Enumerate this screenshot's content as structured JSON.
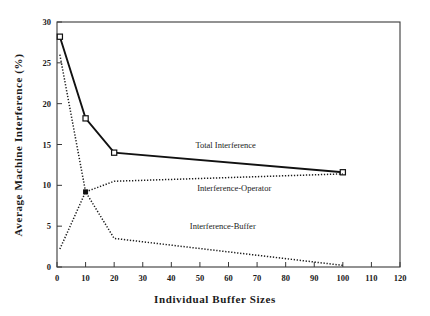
{
  "chart_data": {
    "type": "line",
    "title": "",
    "xlabel": "Individual Buffer Sizes",
    "ylabel": "Average Machine Interference (%)",
    "xlim": [
      0,
      120
    ],
    "ylim": [
      0,
      30
    ],
    "xticks": [
      0,
      10,
      20,
      30,
      40,
      50,
      60,
      70,
      80,
      90,
      100,
      110,
      120
    ],
    "yticks": [
      0,
      5,
      10,
      15,
      20,
      25,
      30
    ],
    "xtick_labels": [
      "0",
      "10",
      "20",
      "30",
      "40",
      "50",
      "60",
      "70",
      "80",
      "90",
      "100",
      "110",
      "120"
    ],
    "ytick_labels": [
      "0",
      "5",
      "10",
      "15",
      "20",
      "25",
      "30"
    ],
    "grid": false,
    "legend_position": "inline-annotations",
    "series": [
      {
        "name": "Total Interference",
        "style": "solid",
        "marker": "open-square",
        "x": [
          1,
          10,
          20,
          100
        ],
        "values": [
          28.2,
          18.2,
          14.0,
          11.6
        ]
      },
      {
        "name": "Interference-Operator",
        "style": "dotted",
        "marker": "none",
        "x": [
          1,
          10,
          20,
          100
        ],
        "values": [
          2.2,
          9.2,
          10.5,
          11.4
        ]
      },
      {
        "name": "Interference-Buffer",
        "style": "dotted",
        "marker": "none",
        "x": [
          1,
          10,
          20,
          100
        ],
        "values": [
          26.0,
          9.2,
          3.5,
          0.2
        ]
      }
    ],
    "annotations": [
      {
        "text": "Total Interference",
        "x": 59,
        "y": 14.6
      },
      {
        "text": "Interference-Operator",
        "x": 62,
        "y": 9.3
      },
      {
        "text": "Interference-Buffer",
        "x": 58,
        "y": 4.6
      }
    ],
    "colors": {
      "axis": "#3a3a3a",
      "total_interference": "#111111",
      "interference_operator": "#1c1c1c",
      "interference_buffer": "#1c1c1c",
      "background": "#ffffff"
    }
  }
}
